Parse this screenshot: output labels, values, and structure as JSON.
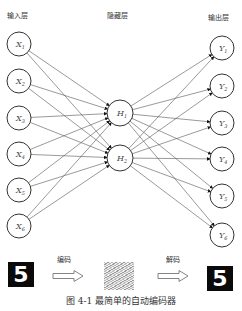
{
  "header": {
    "input_layer_label": "输入层",
    "hidden_layer_label": "隐藏层",
    "output_layer_label": "输出层"
  },
  "nodes": {
    "inputs": [
      "X1",
      "X2",
      "X3",
      "X4",
      "X5",
      "X6"
    ],
    "hidden": [
      "H1",
      "H2"
    ],
    "outputs": [
      "Y1",
      "Y2",
      "Y3",
      "Y4",
      "Y5",
      "Y6"
    ]
  },
  "pipeline": {
    "input_digit": "5",
    "encode_label": "编码",
    "decode_label": "解码",
    "output_digit": "5"
  },
  "caption": "图 4-1   最简单的自动编码器"
}
